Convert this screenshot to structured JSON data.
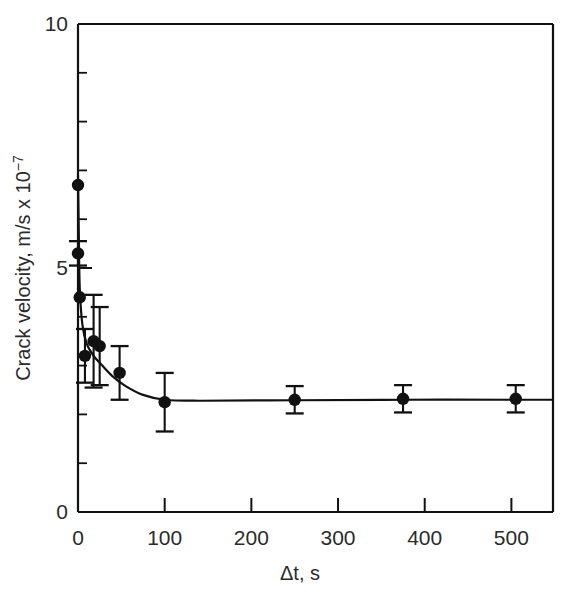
{
  "chart_data": {
    "type": "scatter",
    "title": "",
    "xlabel": "Δt, s",
    "ylabel_parts": {
      "main": "Crack velocity, m/s x 10",
      "exponent": "−7"
    },
    "ylabel": "Crack velocity, m/s x 10−7",
    "xlim": [
      0,
      548
    ],
    "ylim": [
      0,
      10
    ],
    "grid": false,
    "legend": null,
    "xticks": [
      0,
      100,
      200,
      300,
      400,
      500
    ],
    "xtick_labels": [
      "0",
      "100",
      "200",
      "300",
      "400",
      "500"
    ],
    "x_minor_ticks": [],
    "yticks": [
      0,
      5,
      10
    ],
    "ytick_labels": [
      "0",
      "5",
      "10"
    ],
    "y_minor_ticks": [
      1,
      2,
      3,
      4,
      6,
      7,
      8,
      9
    ],
    "series": [
      {
        "name": "Crack velocity vs hold time",
        "marker": "filled-circle",
        "errorbars": "symmetric",
        "points": [
          {
            "x": 0,
            "y": 6.7,
            "yerr": 0.0
          },
          {
            "x": 0,
            "y": 5.3,
            "yerr": 0.25
          },
          {
            "x": 2,
            "y": 4.4,
            "yerr": 0.0
          },
          {
            "x": 8,
            "y": 3.2,
            "yerr": 0.55
          },
          {
            "x": 18,
            "y": 3.5,
            "yerr": 0.95
          },
          {
            "x": 25,
            "y": 3.4,
            "yerr": 0.8
          },
          {
            "x": 48,
            "y": 2.85,
            "yerr": 0.55
          },
          {
            "x": 100,
            "y": 2.25,
            "yerr": 0.6
          },
          {
            "x": 250,
            "y": 2.3,
            "yerr": 0.28
          },
          {
            "x": 375,
            "y": 2.32,
            "yerr": 0.28
          },
          {
            "x": 505,
            "y": 2.32,
            "yerr": 0.28
          }
        ]
      }
    ],
    "fit_curve": {
      "name": "fitted decay curve",
      "description": "steep decay from ~6.9 at t=0 to plateau ~2.28",
      "path_points": [
        {
          "x": 0,
          "y": 6.9
        },
        {
          "x": 1,
          "y": 5.6
        },
        {
          "x": 2,
          "y": 4.6
        },
        {
          "x": 5,
          "y": 3.85
        },
        {
          "x": 10,
          "y": 3.45
        },
        {
          "x": 18,
          "y": 3.2
        },
        {
          "x": 28,
          "y": 3.0
        },
        {
          "x": 40,
          "y": 2.78
        },
        {
          "x": 55,
          "y": 2.58
        },
        {
          "x": 75,
          "y": 2.4
        },
        {
          "x": 100,
          "y": 2.3
        },
        {
          "x": 140,
          "y": 2.28
        },
        {
          "x": 250,
          "y": 2.29
        },
        {
          "x": 375,
          "y": 2.3
        },
        {
          "x": 505,
          "y": 2.3
        },
        {
          "x": 548,
          "y": 2.3
        }
      ]
    }
  }
}
